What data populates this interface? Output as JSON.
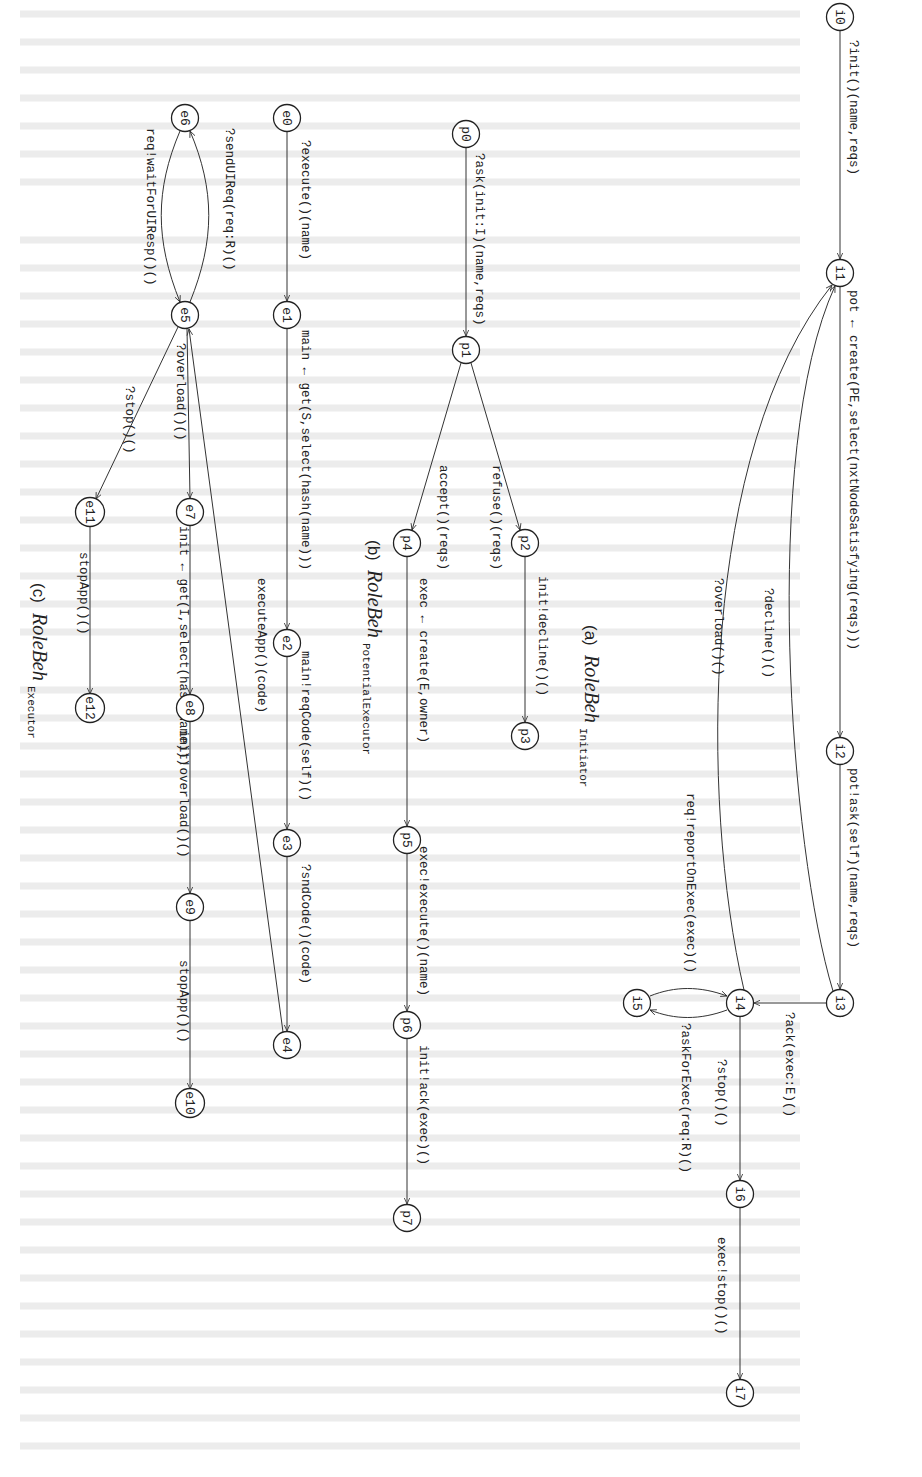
{
  "figure": {
    "orientation": "rotated-90-clockwise",
    "subfigures": [
      {
        "id": "a",
        "caption": {
          "letter": "(a)",
          "name": "RoleBeh",
          "subscript": "Initiator"
        },
        "nodes": [
          {
            "id": "i0",
            "x": 840,
            "y": 17
          },
          {
            "id": "i1",
            "x": 840,
            "y": 273
          },
          {
            "id": "i2",
            "x": 840,
            "y": 751
          },
          {
            "id": "i3",
            "x": 840,
            "y": 1003
          },
          {
            "id": "i4",
            "x": 740,
            "y": 1003
          },
          {
            "id": "i5",
            "x": 637,
            "y": 1003
          },
          {
            "id": "i6",
            "x": 740,
            "y": 1194
          },
          {
            "id": "i7",
            "x": 740,
            "y": 1393
          }
        ],
        "edges": [
          {
            "from": "i0",
            "to": "i1",
            "label": "?init()(name,reqs)"
          },
          {
            "from": "i1",
            "to": "i2",
            "label": "pot ← create(PE,select(nxtNodeSatisfying(reqs)))"
          },
          {
            "from": "i2",
            "to": "i3",
            "label": "pot!ask(self)(name,reqs)"
          },
          {
            "from": "i3",
            "to": "i1",
            "label": "?decline()()"
          },
          {
            "from": "i3",
            "to": "i4",
            "label": "?ack(exec:E)()"
          },
          {
            "from": "i4",
            "to": "i1",
            "label": "?overload()()"
          },
          {
            "from": "i4",
            "to": "i5",
            "label": "?askForExec(req:R)()"
          },
          {
            "from": "i5",
            "to": "i4",
            "label": "req!reportOnExec(exec)()"
          },
          {
            "from": "i4",
            "to": "i6",
            "label": "?stop()()"
          },
          {
            "from": "i6",
            "to": "i7",
            "label": "exec!stop()()"
          }
        ]
      },
      {
        "id": "b",
        "caption": {
          "letter": "(b)",
          "name": "RoleBeh",
          "subscript": "PotentialExecutor"
        },
        "nodes": [
          {
            "id": "p0",
            "x": 466,
            "y": 134
          },
          {
            "id": "p1",
            "x": 466,
            "y": 350
          },
          {
            "id": "p2",
            "x": 525,
            "y": 543
          },
          {
            "id": "p3",
            "x": 525,
            "y": 736
          },
          {
            "id": "p4",
            "x": 407,
            "y": 543
          },
          {
            "id": "p5",
            "x": 407,
            "y": 840
          },
          {
            "id": "p6",
            "x": 407,
            "y": 1025
          },
          {
            "id": "p7",
            "x": 407,
            "y": 1218
          }
        ],
        "edges": [
          {
            "from": "p0",
            "to": "p1",
            "label": "?ask(init:I)(name,reqs)"
          },
          {
            "from": "p1",
            "to": "p2",
            "label": "refuse()(reqs)"
          },
          {
            "from": "p2",
            "to": "p3",
            "label": "init!decline()()"
          },
          {
            "from": "p1",
            "to": "p4",
            "label": "accept()(reqs)"
          },
          {
            "from": "p4",
            "to": "p5",
            "label": "exec ← create(E,owner)"
          },
          {
            "from": "p5",
            "to": "p6",
            "label": "exec!execute()(name)"
          },
          {
            "from": "p6",
            "to": "p7",
            "label": "init!ack(exec)()"
          }
        ]
      },
      {
        "id": "c",
        "caption": {
          "letter": "(c)",
          "name": "RoleBeh",
          "subscript": "Executor"
        },
        "nodes": [
          {
            "id": "e0",
            "x": 287,
            "y": 118
          },
          {
            "id": "e1",
            "x": 287,
            "y": 315
          },
          {
            "id": "e2",
            "x": 287,
            "y": 643
          },
          {
            "id": "e3",
            "x": 287,
            "y": 843
          },
          {
            "id": "e4",
            "x": 287,
            "y": 1045
          },
          {
            "id": "e5",
            "x": 185,
            "y": 315
          },
          {
            "id": "e6",
            "x": 185,
            "y": 118
          },
          {
            "id": "e7",
            "x": 190,
            "y": 512
          },
          {
            "id": "e8",
            "x": 190,
            "y": 708
          },
          {
            "id": "e9",
            "x": 190,
            "y": 907
          },
          {
            "id": "e10",
            "x": 190,
            "y": 1103
          },
          {
            "id": "e11",
            "x": 90,
            "y": 512
          },
          {
            "id": "e12",
            "x": 90,
            "y": 708
          }
        ],
        "edges": [
          {
            "from": "e0",
            "to": "e1",
            "label": "?execute()(name)"
          },
          {
            "from": "e1",
            "to": "e2",
            "label": "main ← get(S,select(hash(name)))"
          },
          {
            "from": "e2",
            "to": "e3",
            "label": "main!reqCode(self)()"
          },
          {
            "from": "e3",
            "to": "e4",
            "label": "?sndCode()(code)"
          },
          {
            "from": "e4",
            "to": "e5",
            "label": "executeApp()(code)"
          },
          {
            "from": "e5",
            "to": "e6",
            "label": "?sendUIReq(req:R)()"
          },
          {
            "from": "e6",
            "to": "e5",
            "label": "req!waitForUIResp()()"
          },
          {
            "from": "e5",
            "to": "e7",
            "label": "?overload()()"
          },
          {
            "from": "e7",
            "to": "e8",
            "label": "init ← get(I,select(hash(name)))"
          },
          {
            "from": "e8",
            "to": "e9",
            "label": "init!overload()()"
          },
          {
            "from": "e9",
            "to": "e10",
            "label": "stopApp()()"
          },
          {
            "from": "e5",
            "to": "e11",
            "label": "?stop()()"
          },
          {
            "from": "e11",
            "to": "e12",
            "label": "stopApp()()"
          }
        ]
      }
    ]
  },
  "labels": {
    "i0": "i0",
    "i1": "i1",
    "i2": "i2",
    "i3": "i3",
    "i4": "i4",
    "i5": "i5",
    "i6": "i6",
    "i7": "i7",
    "p0": "p0",
    "p1": "p1",
    "p2": "p2",
    "p3": "p3",
    "p4": "p4",
    "p5": "p5",
    "p6": "p6",
    "p7": "p7",
    "e0": "e0",
    "e1": "e1",
    "e2": "e2",
    "e3": "e3",
    "e4": "e4",
    "e5": "e5",
    "e6": "e6",
    "e7": "e7",
    "e8": "e8",
    "e9": "e9",
    "e10": "e10",
    "e11": "e11",
    "e12": "e12",
    "a_i0_i1": "?init()(name,reqs)",
    "a_i1_i2": "pot ← create(PE,select(nxtNodeSatisfying(reqs)))",
    "a_i2_i3": "pot!ask(self)(name,reqs)",
    "a_i3_i1": "?decline()()",
    "a_i3_i4": "?ack(exec:E)()",
    "a_i4_i1": "?overload()()",
    "a_i4_i5": "?askForExec(req:R)()",
    "a_i5_i4": "req!reportOnExec(exec)()",
    "a_i4_i6": "?stop()()",
    "a_i6_i7": "exec!stop()()",
    "b_p0_p1": "?ask(init:I)(name,reqs)",
    "b_p1_p2": "refuse()(reqs)",
    "b_p2_p3": "init!decline()()",
    "b_p1_p4": "accept()(reqs)",
    "b_p4_p5": "exec ← create(E,owner)",
    "b_p5_p6": "exec!execute()(name)",
    "b_p6_p7": "init!ack(exec)()",
    "c_e0_e1": "?execute()(name)",
    "c_e1_e2": "main ← get(S,select(hash(name)))",
    "c_e2_e3": "main!reqCode(self)()",
    "c_e3_e4": "?sndCode()(code)",
    "c_e4_e5": "executeApp()(code)",
    "c_e5_e6": "?sendUIReq(req:R)()",
    "c_e6_e5": "req!waitForUIResp()()",
    "c_e5_e7": "?overload()()",
    "c_e7_e8": "init ← get(I,select(hash(name)))",
    "c_e8_e9": "init!overload()()",
    "c_e9_e10": "stopApp()()",
    "c_e5_e11": "?stop()()",
    "c_e11_e12": "stopApp()()",
    "cap_a_letter": "(a)",
    "cap_a_name": "RoleBeh",
    "cap_a_sub": "Initiator",
    "cap_b_letter": "(b)",
    "cap_b_name": "RoleBeh",
    "cap_b_sub": "PotentialExecutor",
    "cap_c_letter": "(c)",
    "cap_c_name": "RoleBeh",
    "cap_c_sub": "Executor"
  }
}
